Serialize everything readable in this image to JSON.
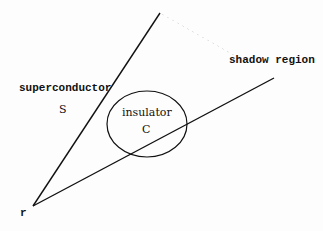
{
  "diagram": {
    "labels": {
      "superconductor": "superconductor",
      "superconductor_symbol": "S",
      "insulator": "insulator",
      "insulator_symbol": "C",
      "shadow": "shadow region",
      "point": "r"
    },
    "geometry": {
      "apex": [
        33,
        206
      ],
      "upper_line_end": [
        160,
        13
      ],
      "lower_line_end": [
        274,
        78
      ],
      "ellipse": {
        "cx": 147,
        "cy": 124,
        "rx": 40,
        "ry": 33
      }
    },
    "colors": {
      "line": "#111111",
      "background": "#fdfdfd"
    }
  }
}
